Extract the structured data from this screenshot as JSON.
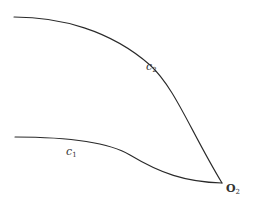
{
  "diagram": {
    "curves": [
      {
        "id": "c2",
        "label_base": "c",
        "label_sub": "2",
        "start": [
          14,
          17
        ],
        "end": [
          222,
          183
        ]
      },
      {
        "id": "c1",
        "label_base": "c",
        "label_sub": "1",
        "start": [
          15,
          137
        ],
        "end": [
          222,
          183
        ]
      }
    ],
    "point": {
      "label_base": "O",
      "label_sub": "2",
      "position": [
        222,
        183
      ]
    },
    "colors": {
      "stroke": "#2a2a2a",
      "text": "#333333",
      "background": "#ffffff"
    }
  }
}
